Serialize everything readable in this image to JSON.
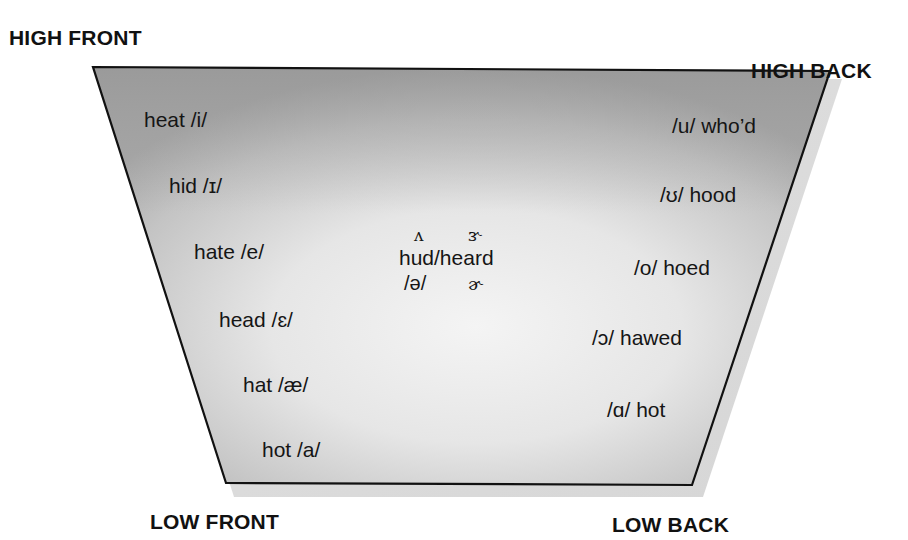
{
  "diagram": {
    "type": "vowel-quadrilateral",
    "colors": {
      "fill_edge": "#a9a9a9",
      "fill_center": "#f2f2f2",
      "outline": "#111111",
      "shadow": "#dcdcdc",
      "text": "#151515"
    },
    "corners": {
      "high_front": "HIGH FRONT",
      "high_back": "HIGH BACK",
      "low_front": "LOW FRONT",
      "low_back": "LOW BACK"
    },
    "front_vowels": [
      {
        "word": "heat",
        "ipa": "/i/",
        "label": "heat /i/"
      },
      {
        "word": "hid",
        "ipa": "/ɪ/",
        "label": "hid /ɪ/"
      },
      {
        "word": "hate",
        "ipa": "/e/",
        "label": "hate /e/"
      },
      {
        "word": "head",
        "ipa": "/ɛ/",
        "label": "head /ɛ/"
      },
      {
        "word": "hat",
        "ipa": "/æ/",
        "label": "hat /æ/"
      },
      {
        "word": "hot",
        "ipa": "/a/",
        "label": "hot /a/"
      }
    ],
    "back_vowels": [
      {
        "word": "who'd",
        "ipa": "/u/",
        "label": "/u/ who’d"
      },
      {
        "word": "hood",
        "ipa": "/ʊ/",
        "label": "/ʊ/ hood"
      },
      {
        "word": "hoed",
        "ipa": "/o/",
        "label": "/o/ hoed"
      },
      {
        "word": "hawed",
        "ipa": "/ɔ/",
        "label": "/ɔ/ hawed"
      },
      {
        "word": "hot",
        "ipa": "/ɑ/",
        "label": "/ɑ/ hot"
      }
    ],
    "central_vowels": {
      "top_left_symbol": "ʌ",
      "top_right_symbol": "ɝ",
      "words": "hud/heard",
      "bottom_left_symbol": "/ə/",
      "bottom_right_symbol": "ɚ"
    }
  }
}
